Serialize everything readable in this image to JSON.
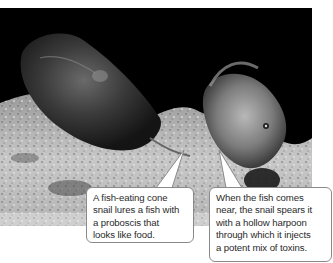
{
  "figure": {
    "photo": {
      "description": "Cone snail on sandy seabed beside a fish",
      "subjects": [
        "cone-snail",
        "fish",
        "seabed"
      ]
    },
    "callouts": [
      {
        "id": "left",
        "lines": [
          "A fish-eating cone",
          "snail lures a fish with",
          "a proboscis that",
          "looks like food."
        ]
      },
      {
        "id": "right",
        "lines": [
          "When the fish comes",
          "near, the snail spears it",
          "with a hollow harpoon",
          "through which it injects",
          "a potent mix of toxins."
        ]
      }
    ],
    "colors": {
      "background": "#ffffff",
      "photo_dark": "#000000",
      "callout_border": "#8a8a8a",
      "text": "#2a2a2a"
    }
  }
}
